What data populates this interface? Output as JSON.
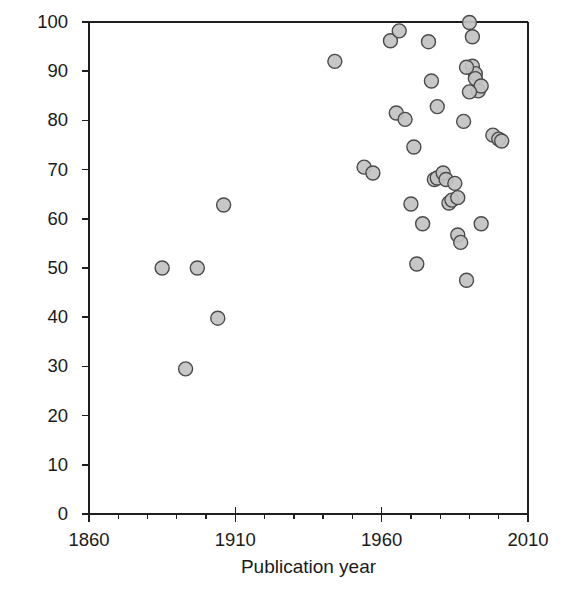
{
  "chart_data": {
    "type": "scatter",
    "title": "",
    "xlabel": "Publication year",
    "ylabel": "Incidence (%)",
    "xlim": [
      1860,
      2010
    ],
    "ylim": [
      0,
      100
    ],
    "xticks": [
      1860,
      1910,
      1960,
      2010
    ],
    "xtick_labels": [
      "1860",
      "1910",
      "1960",
      "2010"
    ],
    "x_minor_tick_interval": 10,
    "yticks": [
      0,
      10,
      20,
      30,
      40,
      50,
      60,
      70,
      80,
      90,
      100
    ],
    "ytick_labels": [
      "0",
      "10",
      "20",
      "30",
      "40",
      "50",
      "60",
      "70",
      "80",
      "90",
      "100"
    ],
    "grid": false,
    "legend": false,
    "legend_position": "none",
    "marker": {
      "shape": "circle",
      "diameter_px": 14,
      "fill_color": "#c2c2c2",
      "edge_color": "#4a4a4a",
      "edge_width_px": 1.4
    },
    "axis_color": "#1f1f1f",
    "background_color": "#ffffff",
    "n_points": 44,
    "points": [
      {
        "x": 1885,
        "y": 50.0
      },
      {
        "x": 1893,
        "y": 29.5
      },
      {
        "x": 1897,
        "y": 50.0
      },
      {
        "x": 1904,
        "y": 39.8
      },
      {
        "x": 1906,
        "y": 62.8
      },
      {
        "x": 1944,
        "y": 92.0
      },
      {
        "x": 1954,
        "y": 70.5
      },
      {
        "x": 1957,
        "y": 69.3
      },
      {
        "x": 1963,
        "y": 96.2
      },
      {
        "x": 1965,
        "y": 81.5
      },
      {
        "x": 1966,
        "y": 98.2
      },
      {
        "x": 1968,
        "y": 80.2
      },
      {
        "x": 1970,
        "y": 63.0
      },
      {
        "x": 1971,
        "y": 74.6
      },
      {
        "x": 1972,
        "y": 50.8
      },
      {
        "x": 1974,
        "y": 59.0
      },
      {
        "x": 1976,
        "y": 96.0
      },
      {
        "x": 1977,
        "y": 88.0
      },
      {
        "x": 1978,
        "y": 68.0
      },
      {
        "x": 1979,
        "y": 68.3
      },
      {
        "x": 1979,
        "y": 82.8
      },
      {
        "x": 1981,
        "y": 69.3
      },
      {
        "x": 1982,
        "y": 68.0
      },
      {
        "x": 1983,
        "y": 63.2
      },
      {
        "x": 1984,
        "y": 63.8
      },
      {
        "x": 1985,
        "y": 67.2
      },
      {
        "x": 1986,
        "y": 64.3
      },
      {
        "x": 1986,
        "y": 56.7
      },
      {
        "x": 1987,
        "y": 55.2
      },
      {
        "x": 1988,
        "y": 79.8
      },
      {
        "x": 1989,
        "y": 47.5
      },
      {
        "x": 1990,
        "y": 99.9
      },
      {
        "x": 1991,
        "y": 97.0
      },
      {
        "x": 1991,
        "y": 91.0
      },
      {
        "x": 1992,
        "y": 89.5
      },
      {
        "x": 1992,
        "y": 88.5
      },
      {
        "x": 1993,
        "y": 86.0
      },
      {
        "x": 1994,
        "y": 87.0
      },
      {
        "x": 1994,
        "y": 59.0
      },
      {
        "x": 1998,
        "y": 77.0
      },
      {
        "x": 2000,
        "y": 76.2
      },
      {
        "x": 2001,
        "y": 75.8
      },
      {
        "x": 1989,
        "y": 90.8
      },
      {
        "x": 1990,
        "y": 85.8
      }
    ]
  },
  "plot_geometry": {
    "left_px": 89,
    "right_px": 528,
    "top_px": 22,
    "bottom_px": 514
  }
}
